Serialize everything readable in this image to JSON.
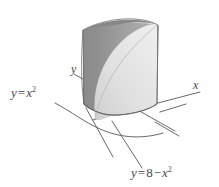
{
  "figure": {
    "kind": "3d-solid-diagram",
    "background_color": "#ffffff",
    "ink_color": "#4a4a4a",
    "axes": [
      {
        "name": "y-axis",
        "label": "y",
        "label_x": 71,
        "label_y": 63
      },
      {
        "name": "x-axis",
        "label": "x",
        "label_x": 193,
        "label_y": 79
      }
    ],
    "curve_labels": [
      {
        "name": "parabola-lower",
        "lhs": "y",
        "op": "=",
        "rhs_base": "x",
        "rhs_exp": "2",
        "full_text": "y = x²",
        "x": 11,
        "y": 86
      },
      {
        "name": "parabola-upper",
        "lhs": "y",
        "op": "=",
        "constant": "8",
        "minus": "−",
        "rhs_base": "x",
        "rhs_exp": "2",
        "full_text": "y = 8 − x²",
        "x": 131,
        "y": 166
      }
    ],
    "surface": {
      "wall_shade_dark": "#8d8d8d",
      "wall_shade_mid": "#a0a0a0",
      "wall_shade_light": "#b4b4b4",
      "front_face_light": "#e6e6e6",
      "front_face_mid": "#d2d2d2",
      "top_edge_color": "#7a7a7a",
      "outline_color": "#555555"
    }
  }
}
